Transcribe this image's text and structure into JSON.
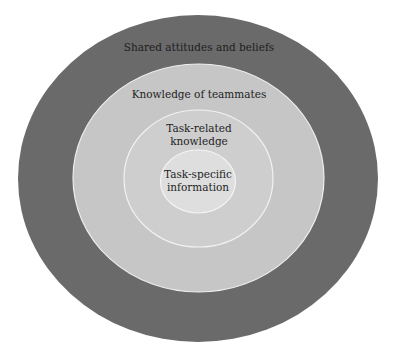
{
  "diagram": {
    "type": "concentric-circles",
    "layers": [
      {
        "label": "Shared attitudes and beliefs",
        "fill": "#6a6a6a",
        "cx": 198,
        "cy": 178.5,
        "rx": 180,
        "ry": 163.5
      },
      {
        "label": "Knowledge of teammates",
        "fill": "#c6c6c6",
        "cx": 198.5,
        "cy": 178,
        "rx": 125.5,
        "ry": 114
      },
      {
        "label_line1": "Task-related",
        "label_line2": "knowledge",
        "fill": "#cecece",
        "cx": 198.5,
        "cy": 178.5,
        "rx": 74.5,
        "ry": 68.5
      },
      {
        "label_line1": "Task-specific",
        "label_line2": "information",
        "fill": "#dedede",
        "cx": 198,
        "cy": 181.5,
        "rx": 37.5,
        "ry": 31.5
      }
    ],
    "ring_stroke": "#eeeeee"
  }
}
